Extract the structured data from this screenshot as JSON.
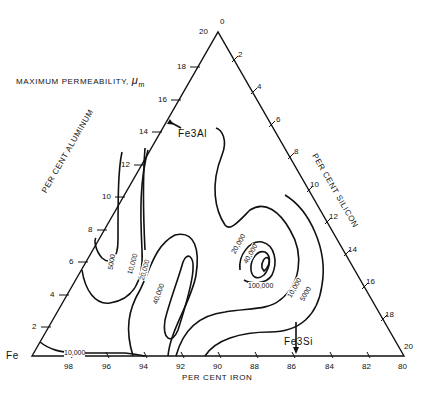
{
  "title": "MAXIMUM PERMEABILITY, μm",
  "title_main": "MAXIMUM PERMEABILITY,",
  "title_symbol": "μ",
  "title_sub": "m",
  "axes": {
    "bottom": {
      "label": "PER CENT IRON",
      "ticks": [
        "98",
        "96",
        "94",
        "92",
        "90",
        "88",
        "86",
        "84",
        "82",
        "80"
      ]
    },
    "left": {
      "label": "PER CENT ALUMINUM",
      "ticks": [
        "2",
        "4",
        "6",
        "8",
        "10",
        "12",
        "14",
        "16",
        "18",
        "20"
      ]
    },
    "right": {
      "label": "PER CENT SILICON",
      "ticks": [
        "0",
        "2",
        "4",
        "6",
        "8",
        "10",
        "12",
        "14",
        "16",
        "18",
        "20"
      ]
    }
  },
  "corners": {
    "fe": "Fe"
  },
  "compounds": {
    "fe3al": "Fe3Al",
    "fe3si": "Fe3Si"
  },
  "contours": [
    "5000",
    "10,000",
    "20,000",
    "40,000",
    "100,000",
    "20,000",
    "40,000",
    "10,000",
    "5000",
    "10,000"
  ]
}
